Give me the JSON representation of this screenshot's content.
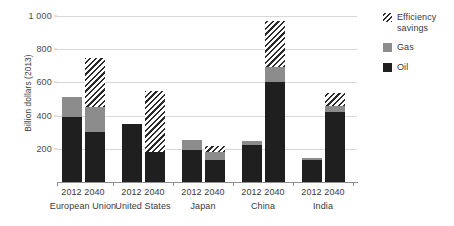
{
  "chart_data": {
    "type": "bar",
    "stacked": true,
    "title": "",
    "xlabel": "",
    "ylabel": "Billion dollars (2013)",
    "ylim": [
      0,
      1000
    ],
    "yticks": [
      200,
      400,
      600,
      800,
      1000
    ],
    "ytick_labels": [
      "200",
      "400",
      "600",
      "800",
      "1 000"
    ],
    "grid": "horizontal",
    "legend_position": "right",
    "groups": [
      "European Union",
      "United States",
      "Japan",
      "China",
      "India"
    ],
    "years": [
      "2012",
      "2040"
    ],
    "categories": [
      "European Union 2012",
      "European Union 2040",
      "United States 2012",
      "United States 2040",
      "Japan 2012",
      "Japan 2040",
      "China 2012",
      "China 2040",
      "India 2012",
      "India 2040"
    ],
    "series": [
      {
        "name": "Oil",
        "color": "#1f1f1f",
        "values": [
          390,
          300,
          350,
          180,
          195,
          130,
          225,
          600,
          130,
          420
        ]
      },
      {
        "name": "Gas",
        "color": "#8c8c8c",
        "values": [
          120,
          150,
          0,
          0,
          60,
          50,
          25,
          90,
          15,
          40
        ]
      },
      {
        "name": "Efficiency savings",
        "color": "hatched",
        "values": [
          0,
          300,
          0,
          370,
          0,
          40,
          0,
          280,
          0,
          75
        ]
      }
    ],
    "totals": [
      510,
      750,
      350,
      550,
      255,
      220,
      250,
      970,
      145,
      535
    ]
  },
  "axis": {
    "y_title": "Billion dollars (2013)",
    "ticks": [
      {
        "value": 1000,
        "label": "1 000"
      },
      {
        "value": 800,
        "label": "800"
      },
      {
        "value": 600,
        "label": "600"
      },
      {
        "value": 400,
        "label": "400"
      },
      {
        "value": 200,
        "label": "200"
      }
    ]
  },
  "groups": [
    {
      "name": "European Union",
      "years": [
        "2012",
        "2040"
      ]
    },
    {
      "name": "United States",
      "years": [
        "2012",
        "2040"
      ]
    },
    {
      "name": "Japan",
      "years": [
        "2012",
        "2040"
      ]
    },
    {
      "name": "China",
      "years": [
        "2012",
        "2040"
      ]
    },
    {
      "name": "India",
      "years": [
        "2012",
        "2040"
      ]
    }
  ],
  "legend": {
    "items": [
      {
        "label": "Efficiency savings",
        "swatch": "eff"
      },
      {
        "label": "Gas",
        "swatch": "gas"
      },
      {
        "label": "Oil",
        "swatch": "oil"
      }
    ]
  }
}
